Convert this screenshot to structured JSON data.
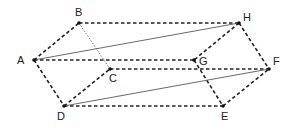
{
  "figure": {
    "type": "prism diagram",
    "labels": {
      "A": "A",
      "B": "B",
      "C": "C",
      "D": "D",
      "E": "E",
      "F": "F",
      "G": "G",
      "H": "H"
    },
    "edges": [
      {
        "from": "A",
        "to": "B",
        "style": "dashed"
      },
      {
        "from": "A",
        "to": "D",
        "style": "dashed"
      },
      {
        "from": "D",
        "to": "C",
        "style": "dashed"
      },
      {
        "from": "B",
        "to": "C",
        "style": "dotted"
      },
      {
        "from": "A",
        "to": "G",
        "style": "dashed"
      },
      {
        "from": "B",
        "to": "H",
        "style": "dashed"
      },
      {
        "from": "C",
        "to": "F",
        "style": "dashed"
      },
      {
        "from": "D",
        "to": "E",
        "style": "dashed"
      },
      {
        "from": "H",
        "to": "G",
        "style": "dashed"
      },
      {
        "from": "G",
        "to": "E",
        "style": "dashed"
      },
      {
        "from": "H",
        "to": "F",
        "style": "dashed"
      },
      {
        "from": "E",
        "to": "F",
        "style": "dashed"
      },
      {
        "from": "A",
        "to": "H",
        "style": "solid"
      },
      {
        "from": "D",
        "to": "F",
        "style": "solid"
      }
    ]
  }
}
